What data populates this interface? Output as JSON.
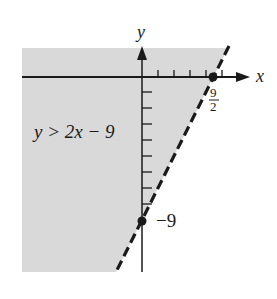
{
  "diagram": {
    "type": "linear-inequality-graph",
    "inequality_label": "y > 2x − 9",
    "boundary_line": {
      "equation": "y = 2x - 9",
      "style": "dashed"
    },
    "shaded_region": "above-left of line",
    "axes": {
      "x_label": "x",
      "y_label": "y"
    },
    "points": [
      {
        "name": "x-intercept",
        "label_num": "9",
        "label_den": "2",
        "x": 4.5,
        "y": 0
      },
      {
        "name": "y-intercept",
        "label": "−9",
        "x": 0,
        "y": -9
      }
    ],
    "colors": {
      "shade": "#d9d9d9",
      "line": "#1a1a1a"
    }
  }
}
